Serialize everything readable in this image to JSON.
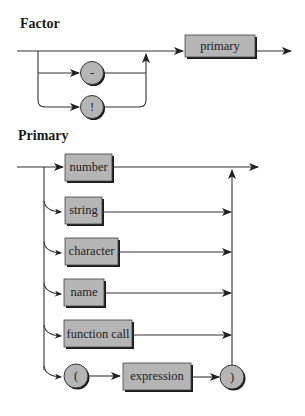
{
  "factor": {
    "title": "Factor",
    "options": [
      {
        "symbol": "-",
        "kind": "terminal"
      },
      {
        "symbol": "!",
        "kind": "terminal"
      }
    ],
    "nonterminal": "primary"
  },
  "primary": {
    "title": "Primary",
    "alternatives": [
      {
        "label": "number",
        "kind": "nonterminal"
      },
      {
        "label": "string",
        "kind": "nonterminal"
      },
      {
        "label": "character",
        "kind": "nonterminal"
      },
      {
        "label": "name",
        "kind": "nonterminal"
      },
      {
        "label": "function call",
        "kind": "nonterminal"
      }
    ],
    "paren_sequence": {
      "open": "(",
      "inner": "expression",
      "close": ")"
    }
  },
  "colors": {
    "box_fill": "#b5b5b5",
    "line": "#333333",
    "shadow": "#1a1a1a"
  }
}
